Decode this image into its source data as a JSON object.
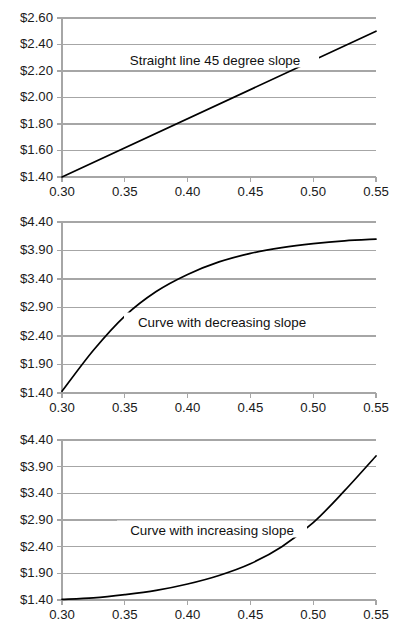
{
  "chart_data": [
    {
      "type": "line",
      "id": "straight-line-45-degree-slope",
      "title": "",
      "annotation": "Straight line 45 degree slope",
      "xlabel": "",
      "ylabel": "",
      "grid": true,
      "legend": "none",
      "xlim": [
        0.3,
        0.55
      ],
      "ylim": [
        1.4,
        2.6
      ],
      "xticks": [
        0.3,
        0.35,
        0.4,
        0.45,
        0.5,
        0.55
      ],
      "xtick_labels": [
        "0.30",
        "0.35",
        "0.40",
        "0.45",
        "0.50",
        "0.55"
      ],
      "yticks": [
        1.4,
        1.6,
        1.8,
        2.0,
        2.2,
        2.4,
        2.6
      ],
      "ytick_labels": [
        "$1.40",
        "$1.60",
        "$1.80",
        "$2.00",
        "$2.20",
        "$2.40",
        "$2.60"
      ],
      "x": [
        0.3,
        0.35,
        0.4,
        0.45,
        0.5,
        0.55
      ],
      "values": [
        1.4,
        1.62,
        1.84,
        2.06,
        2.28,
        2.5
      ]
    },
    {
      "type": "line",
      "id": "curve-with-decreasing-slope",
      "title": "",
      "annotation": "Curve with decreasing slope",
      "xlabel": "",
      "ylabel": "",
      "grid": true,
      "legend": "none",
      "xlim": [
        0.3,
        0.55
      ],
      "ylim": [
        1.4,
        4.4
      ],
      "xticks": [
        0.3,
        0.35,
        0.4,
        0.45,
        0.5,
        0.55
      ],
      "xtick_labels": [
        "0.30",
        "0.35",
        "0.40",
        "0.45",
        "0.50",
        "0.55"
      ],
      "yticks": [
        1.4,
        1.9,
        2.4,
        2.9,
        3.4,
        3.9,
        4.4
      ],
      "ytick_labels": [
        "$1.40",
        "$1.90",
        "$2.40",
        "$2.90",
        "$3.40",
        "$3.90",
        "$4.40"
      ],
      "x": [
        0.3,
        0.325,
        0.35,
        0.375,
        0.4,
        0.425,
        0.45,
        0.475,
        0.5,
        0.525,
        0.55
      ],
      "values": [
        1.43,
        2.15,
        2.75,
        3.18,
        3.48,
        3.7,
        3.85,
        3.95,
        4.02,
        4.07,
        4.1
      ]
    },
    {
      "type": "line",
      "id": "curve-with-increasing-slope",
      "title": "",
      "annotation": "Curve with increasing slope",
      "xlabel": "",
      "ylabel": "",
      "grid": true,
      "legend": "none",
      "xlim": [
        0.3,
        0.55
      ],
      "ylim": [
        1.4,
        4.4
      ],
      "xticks": [
        0.3,
        0.35,
        0.4,
        0.45,
        0.5,
        0.55
      ],
      "xtick_labels": [
        "0.30",
        "0.35",
        "0.40",
        "0.45",
        "0.50",
        "0.55"
      ],
      "yticks": [
        1.4,
        1.9,
        2.4,
        2.9,
        3.4,
        3.9,
        4.4
      ],
      "ytick_labels": [
        "$1.40",
        "$1.90",
        "$2.40",
        "$2.90",
        "$3.40",
        "$3.90",
        "$4.40"
      ],
      "x": [
        0.3,
        0.325,
        0.35,
        0.375,
        0.4,
        0.425,
        0.45,
        0.475,
        0.5,
        0.525,
        0.55
      ],
      "values": [
        1.41,
        1.44,
        1.5,
        1.58,
        1.7,
        1.86,
        2.08,
        2.4,
        2.85,
        3.45,
        4.1
      ]
    }
  ],
  "colors": {
    "background": "#ffffff",
    "series": "#000000",
    "grid": "#a6a6a6",
    "tick_text": "#1a1a1a",
    "annotation_text": "#111111"
  }
}
